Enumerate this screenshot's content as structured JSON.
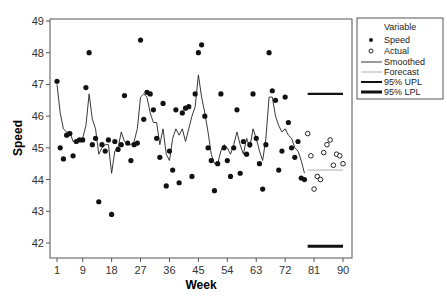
{
  "chart_data": {
    "type": "scatter",
    "title": "",
    "xlabel": "Week",
    "ylabel": "Speed",
    "xlim": [
      0,
      91
    ],
    "ylim": [
      41.6,
      49.1
    ],
    "x_ticks": [
      1,
      9,
      18,
      27,
      36,
      45,
      54,
      63,
      72,
      81,
      90
    ],
    "y_ticks": [
      42,
      43,
      44,
      45,
      46,
      47,
      48,
      49
    ],
    "grid": false,
    "legend_position": "right",
    "legend_title": "Variable",
    "legend": [
      {
        "label": "Speed",
        "marker": "filled-circle"
      },
      {
        "label": "Actual",
        "marker": "open-circle"
      },
      {
        "label": "Smoothed",
        "line": "thin-black"
      },
      {
        "label": "Forecast",
        "line": "thin-gray"
      },
      {
        "label": "95% UPL",
        "line": "thick-black"
      },
      {
        "label": "95% LPL",
        "line": "thicker-black"
      }
    ],
    "series": [
      {
        "name": "Speed",
        "x": [
          1,
          2,
          3,
          4,
          5,
          6,
          7,
          8,
          9,
          10,
          11,
          12,
          13,
          14,
          15,
          16,
          17,
          18,
          19,
          20,
          21,
          22,
          23,
          24,
          25,
          26,
          27,
          28,
          29,
          30,
          31,
          32,
          33,
          34,
          35,
          36,
          37,
          38,
          39,
          40,
          41,
          42,
          43,
          44,
          45,
          46,
          47,
          48,
          49,
          50,
          51,
          52,
          53,
          54,
          55,
          56,
          57,
          58,
          59,
          60,
          61,
          62,
          63,
          64,
          65,
          66,
          67,
          68,
          69,
          70,
          71,
          72,
          73,
          74,
          75,
          76,
          77,
          78
        ],
        "values": [
          47.1,
          45.0,
          44.65,
          45.4,
          45.45,
          44.75,
          45.2,
          45.25,
          45.25,
          46.9,
          48.0,
          45.1,
          45.3,
          43.3,
          45.1,
          44.9,
          45.25,
          42.9,
          45.2,
          44.95,
          45.1,
          46.65,
          45.15,
          44.6,
          45.1,
          45.15,
          48.4,
          45.9,
          46.75,
          46.7,
          46.2,
          45.3,
          44.7,
          46.4,
          43.8,
          44.9,
          44.3,
          46.2,
          43.9,
          46.1,
          46.25,
          46.3,
          44.1,
          46.7,
          48.0,
          48.25,
          46.0,
          45.0,
          44.6,
          43.65,
          44.5,
          46.7,
          45.0,
          44.6,
          44.1,
          45.0,
          46.2,
          44.2,
          45.2,
          44.8,
          45.1,
          46.7,
          45.3,
          44.5,
          43.7,
          45.1,
          48.0,
          46.8,
          46.5,
          44.3,
          44.9,
          46.6,
          45.8,
          45.0,
          44.7,
          45.2,
          44.05,
          44.0
        ]
      },
      {
        "name": "Smoothed",
        "x": [
          1,
          2,
          3,
          4,
          5,
          6,
          7,
          8,
          9,
          10,
          11,
          12,
          13,
          14,
          15,
          16,
          17,
          18,
          19,
          20,
          21,
          22,
          23,
          24,
          25,
          26,
          27,
          28,
          29,
          30,
          31,
          32,
          33,
          34,
          35,
          36,
          37,
          38,
          39,
          40,
          41,
          42,
          43,
          44,
          45,
          46,
          47,
          48,
          49,
          50,
          51,
          52,
          53,
          54,
          55,
          56,
          57,
          58,
          59,
          60,
          61,
          62,
          63,
          64,
          65,
          66,
          67,
          68,
          69,
          70,
          71,
          72,
          73,
          74,
          75,
          76,
          77,
          78
        ],
        "values": [
          47.0,
          46.1,
          45.6,
          45.5,
          45.5,
          45.2,
          45.2,
          45.2,
          45.3,
          45.7,
          46.7,
          45.9,
          45.6,
          44.8,
          45.0,
          45.1,
          45.1,
          44.2,
          44.9,
          45.0,
          45.5,
          45.2,
          45.1,
          45.1,
          45.2,
          45.6,
          46.6,
          46.7,
          46.6,
          46.1,
          45.8,
          45.8,
          45.1,
          45.6,
          44.8,
          44.6,
          45.3,
          45.6,
          45.4,
          45.6,
          45.2,
          45.6,
          46.0,
          46.3,
          47.3,
          46.6,
          46.1,
          45.5,
          44.8,
          44.5,
          44.5,
          44.9,
          45.1,
          45.0,
          44.8,
          45.1,
          45.5,
          45.1,
          44.8,
          45.3,
          45.0,
          45.6,
          45.3,
          44.9,
          44.6,
          45.3,
          46.6,
          46.6,
          46.0,
          45.7,
          45.5,
          45.6,
          45.4,
          45.3,
          45.0,
          44.9,
          44.6,
          44.2
        ]
      },
      {
        "name": "Actual",
        "x": [
          79,
          80,
          81,
          82,
          83,
          84,
          85,
          86,
          87,
          88,
          89,
          90
        ],
        "values": [
          45.45,
          44.75,
          43.7,
          44.1,
          44.0,
          44.85,
          45.1,
          45.25,
          44.45,
          44.8,
          44.75,
          44.5
        ]
      },
      {
        "name": "Forecast",
        "x": [
          79,
          90
        ],
        "values": [
          44.3,
          44.3
        ]
      },
      {
        "name": "95% UPL",
        "x": [
          79,
          90
        ],
        "values": [
          46.7,
          46.7
        ]
      },
      {
        "name": "95% LPL",
        "x": [
          79,
          90
        ],
        "values": [
          41.9,
          41.9
        ]
      }
    ]
  }
}
